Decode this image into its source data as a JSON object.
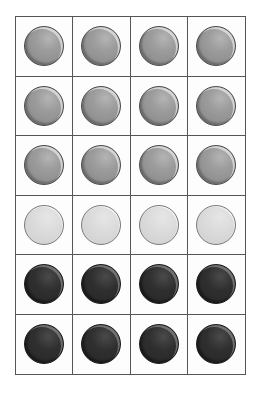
{
  "diagram": {
    "type": "counter-grid",
    "rows": 6,
    "columns": 4,
    "colors": {
      "medium": "#9a9a9a",
      "light": "#d8d8d8",
      "dark": "#2e2e2e",
      "grid_line": "#555555",
      "background": "#ffffff"
    },
    "grid": [
      [
        "medium",
        "medium",
        "medium",
        "medium"
      ],
      [
        "medium",
        "medium",
        "medium",
        "medium"
      ],
      [
        "medium",
        "medium",
        "medium",
        "medium"
      ],
      [
        "light",
        "light",
        "light",
        "light"
      ],
      [
        "dark",
        "dark",
        "dark",
        "dark"
      ],
      [
        "dark",
        "dark",
        "dark",
        "dark"
      ]
    ],
    "counts": {
      "medium": 12,
      "light": 4,
      "dark": 8,
      "total": 24
    }
  }
}
